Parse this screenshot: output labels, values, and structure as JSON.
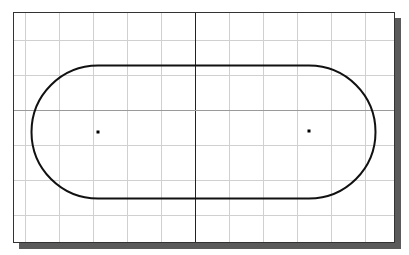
{
  "viewport": {
    "frame": {
      "x": 13,
      "y": 12,
      "width": 382,
      "height": 231
    },
    "shadow_offset": 6,
    "colors": {
      "background": "#ffffff",
      "grid": "#d0d0d0",
      "axis": "#222222",
      "frame": "#333333",
      "shadow": "#5a5a5a",
      "shape": "#111111"
    },
    "grid": {
      "vertical_x": [
        25,
        59,
        93,
        127,
        161,
        229,
        263,
        297,
        331,
        365
      ],
      "horizontal_y": [
        40,
        75,
        145,
        180,
        215
      ]
    },
    "axes": {
      "x_axis_y": 110,
      "y_axis_x": 195
    }
  },
  "shape": {
    "type": "slot",
    "top_y": 66,
    "bottom_y": 199,
    "left_center": {
      "x": 98,
      "y": 132
    },
    "right_center": {
      "x": 309,
      "y": 132
    },
    "radius": 66.5,
    "stroke_width": 2
  },
  "points": [
    {
      "name": "left-arc-center",
      "x": 98,
      "y": 132
    },
    {
      "name": "right-arc-center",
      "x": 309,
      "y": 131
    }
  ]
}
